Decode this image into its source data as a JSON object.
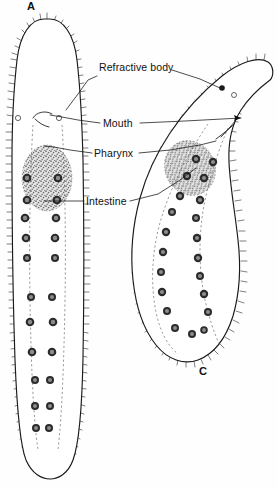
{
  "figure": {
    "background_color": "#fefefe",
    "ink_color": "#111111",
    "panels": [
      {
        "id": "A",
        "label": "A",
        "x": 31,
        "y": 10,
        "description": "straight elongated ciliate, ventral view"
      },
      {
        "id": "C",
        "label": "C",
        "x": 203,
        "y": 375,
        "description": "curved ciliate, body bent toward upper right"
      }
    ],
    "labels": [
      {
        "id": "refractive-body",
        "text": "Refractive body",
        "x": 99,
        "y": 71,
        "anchor": "start",
        "leaders": [
          {
            "target": "A",
            "points": "97,76 88,80 78,94 66,110"
          },
          {
            "target": "C",
            "points": "172,70 200,79 220,88"
          }
        ]
      },
      {
        "id": "mouth",
        "text": "Mouth",
        "x": 103,
        "y": 127,
        "anchor": "start",
        "leaders": [
          {
            "target": "A",
            "points": "100,123 78,120 62,117 50,115"
          },
          {
            "target": "C",
            "points": "140,123 185,121 222,119 241,118"
          }
        ]
      },
      {
        "id": "pharynx",
        "text": "Pharynx",
        "x": 94,
        "y": 157,
        "anchor": "start",
        "leaders": [
          {
            "target": "A",
            "points": "92,153 70,150 54,147 44,146"
          },
          {
            "target": "C",
            "points": "139,153 170,150 200,145 216,141"
          }
        ]
      },
      {
        "id": "intestine",
        "text": "Intestine",
        "x": 86,
        "y": 205,
        "anchor": "start",
        "leaders": [
          {
            "target": "A",
            "points": "84,201 68,201 54,201 44,201"
          },
          {
            "target": "C",
            "points": "130,201 158,194 180,180 196,168"
          }
        ]
      }
    ],
    "organism_A": {
      "name": "organism-a",
      "orientation": "vertical",
      "has_cilia": true,
      "mouth_position": "anterior-ventral",
      "refractive_bodies": 2,
      "nucleus_columns": 2,
      "nucleus_count": 26
    },
    "organism_C": {
      "name": "organism-c",
      "orientation": "curved",
      "has_cilia": true,
      "mouth_position": "anterior-ventral",
      "refractive_bodies": 2,
      "nucleus_columns": 2,
      "nucleus_count": 24
    }
  }
}
